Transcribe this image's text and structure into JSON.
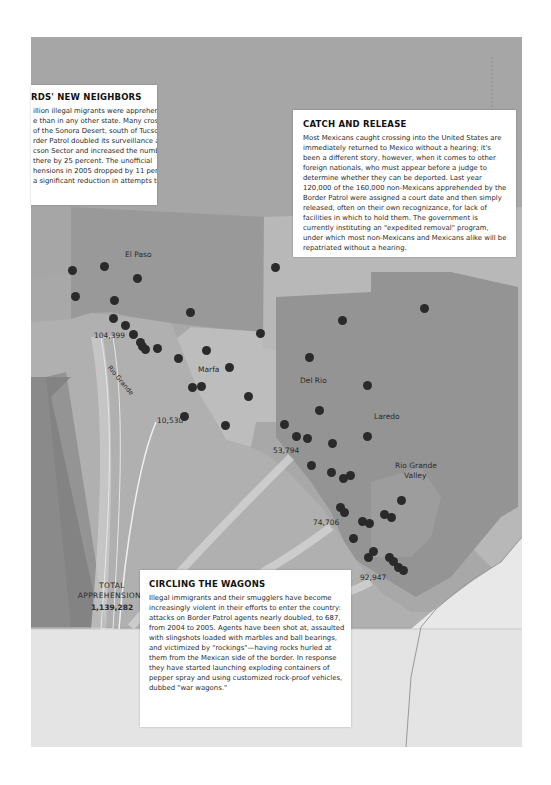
{
  "boxes": {
    "neighbors": {
      "title": "rds' new neighbors",
      "lines": [
        "illion illegal migrants were apprehended",
        "e than in any other state. Many cross",
        "of the Sonora Desert, south of Tucson.",
        "rder Patrol doubled its surveillance air-",
        "cson Sector and increased the number",
        " there by 25 percent. The unofficial",
        "hensions in 2005 dropped by 11 per-",
        "a significant reduction in attempts to"
      ]
    },
    "catch": {
      "title": "Catch and Release",
      "body": "Most Mexicans caught crossing into the United States are immediately returned to Mexico without a hearing; it's been a different story, however, when it comes to other foreign nationals, who must appear before a judge to determine whether they can be deported. Last year 120,000 of the 160,000 non-Mexicans apprehended by the Border Patrol were assigned a court date and then simply released, often on their own recognizance, for lack of facilities in which to hold them. The government is currently instituting an \"expedited removal\" program, under which most non-Mexicans and Mexicans alike will be repatriated without a hearing."
    },
    "wagons": {
      "title": "Circling the Wagons",
      "body": "Illegal immigrants and their smugglers have become increasingly violent in their efforts to enter the country: attacks on Border Patrol agents nearly doubled, to 687, from 2004 to 2005. Agents have been shot at, assaulted with slingshots loaded with marbles and ball bearings, and victimized by \"rockings\"—having rocks hurled at them from the Mexican side of the border. In response they have started launching exploding containers of pepper spray and using customized rock-proof vehicles, dubbed \"war wagons.\""
    }
  },
  "map": {
    "sectors": [
      {
        "name": "El Paso",
        "x": 125,
        "y": 250
      },
      {
        "name": "Marfa",
        "x": 198,
        "y": 365
      },
      {
        "name": "Del Rio",
        "x": 300,
        "y": 376
      },
      {
        "name": "Laredo",
        "x": 374,
        "y": 412
      },
      {
        "name": "Rio Grande",
        "x": 395,
        "y": 461
      },
      {
        "name": "Valley",
        "x": 404,
        "y": 471
      }
    ],
    "river_label": "Rio Grande",
    "apprehension_counts": [
      {
        "value": "104,399",
        "x": 94,
        "y": 331
      },
      {
        "value": "10,530",
        "x": 157,
        "y": 416
      },
      {
        "value": "53,794",
        "x": 273,
        "y": 446
      },
      {
        "value": "74,706",
        "x": 313,
        "y": 518
      },
      {
        "value": "92,947",
        "x": 360,
        "y": 573
      }
    ],
    "total_label_1": "TOTAL",
    "total_label_2": "APPREHENSIONS",
    "total_value": "1,139,282",
    "stations": [
      [
        72,
        270
      ],
      [
        104,
        266
      ],
      [
        137,
        278
      ],
      [
        75,
        296
      ],
      [
        114,
        300
      ],
      [
        113,
        318
      ],
      [
        125,
        325
      ],
      [
        133,
        334
      ],
      [
        140,
        342
      ],
      [
        142,
        346
      ],
      [
        145,
        349
      ],
      [
        157,
        348
      ],
      [
        190,
        312
      ],
      [
        178,
        358
      ],
      [
        206,
        350
      ],
      [
        229,
        367
      ],
      [
        192,
        387
      ],
      [
        201,
        386
      ],
      [
        248,
        396
      ],
      [
        184,
        416
      ],
      [
        225,
        425
      ],
      [
        275,
        267
      ],
      [
        260,
        333
      ],
      [
        342,
        320
      ],
      [
        424,
        308
      ],
      [
        309,
        357
      ],
      [
        367,
        385
      ],
      [
        319,
        410
      ],
      [
        284,
        424
      ],
      [
        296,
        436
      ],
      [
        307,
        438
      ],
      [
        332,
        443
      ],
      [
        367,
        436
      ],
      [
        311,
        465
      ],
      [
        331,
        472
      ],
      [
        350,
        475
      ],
      [
        343,
        478
      ],
      [
        340,
        507
      ],
      [
        344,
        512
      ],
      [
        362,
        521
      ],
      [
        353,
        538
      ],
      [
        391,
        517
      ],
      [
        384,
        514
      ],
      [
        369,
        523
      ],
      [
        373,
        551
      ],
      [
        368,
        557
      ],
      [
        389,
        557
      ],
      [
        393,
        561
      ],
      [
        398,
        567
      ],
      [
        403,
        570
      ],
      [
        401,
        500
      ]
    ]
  },
  "colors": {
    "map_base": "#a9a9a9",
    "west_region": "#9a9a9a",
    "mexico": "#b3b3b3",
    "texas_light": "#bcbcbc",
    "sector_dark": "#8f8f8f",
    "gulf": "#e6e6e6",
    "dot": "#2a2a2a"
  }
}
